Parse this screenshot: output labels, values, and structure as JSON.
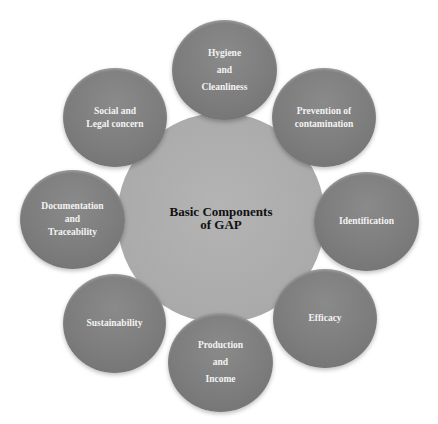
{
  "diagram": {
    "type": "radial-hub",
    "center": {
      "label": "Basic Components\nof GAP",
      "color": "#aaaaaa"
    },
    "node_color": "#7d7d7d",
    "nodes": [
      {
        "label": "Hygiene\nand\nCleanliness",
        "position": "top"
      },
      {
        "label": "Prevention of\ncontamination",
        "position": "top-right"
      },
      {
        "label": "Identification",
        "position": "right"
      },
      {
        "label": "Efficacy",
        "position": "bottom-right"
      },
      {
        "label": "Production\nand\nIncome",
        "position": "bottom"
      },
      {
        "label": "Sustainability",
        "position": "bottom-left"
      },
      {
        "label": "Documentation\nand\nTraceability",
        "position": "left"
      },
      {
        "label": "Social and\nLegal concern",
        "position": "top-left"
      }
    ]
  }
}
